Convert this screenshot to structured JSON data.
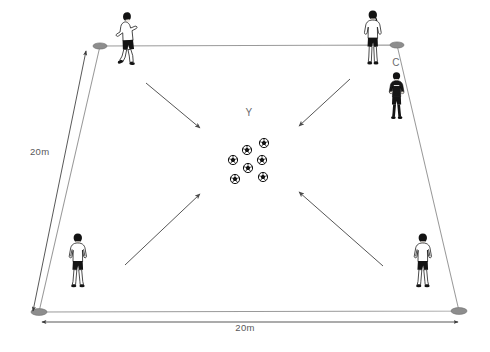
{
  "diagram": {
    "background_color": "#ffffff",
    "grid": {
      "line_color": "#9a9a9a",
      "corners": [
        {
          "name": "top-left",
          "x": 100,
          "y": 46
        },
        {
          "name": "top-right",
          "x": 397,
          "y": 45
        },
        {
          "name": "bottom-right",
          "x": 459,
          "y": 311
        },
        {
          "name": "bottom-left",
          "x": 39,
          "y": 312
        }
      ],
      "marker_color": "#8d8d8d"
    },
    "dimensions": [
      {
        "name": "left-side-dimension",
        "label": "20m",
        "label_x": 30,
        "label_y": 155,
        "from_x": 33,
        "from_y": 311,
        "to_x": 86,
        "to_y": 51
      },
      {
        "name": "bottom-dimension",
        "label": "20m",
        "label_x": 245,
        "label_y": 331,
        "from_x": 42,
        "from_y": 322,
        "to_x": 458,
        "to_y": 322
      }
    ],
    "labels": [
      {
        "name": "coach-label",
        "text": "C",
        "x": 396,
        "y": 66
      },
      {
        "name": "ball-group-label",
        "text": "Y",
        "x": 249,
        "y": 116
      }
    ],
    "players": [
      {
        "name": "player-top-left",
        "id": "P1",
        "x": 128,
        "y": 43,
        "kit": "white-shirt-black-shorts",
        "pose": "kicking"
      },
      {
        "name": "player-top-right",
        "id": "P2",
        "x": 375,
        "y": 40,
        "kit": "white-shirt-black-shorts",
        "pose": "standing-back-ponytail"
      },
      {
        "name": "player-bottom-left",
        "id": "P3",
        "x": 83,
        "y": 263,
        "kit": "white-shirt-black-shorts",
        "pose": "standing-back"
      },
      {
        "name": "player-bottom-right",
        "id": "P4",
        "x": 428,
        "y": 263,
        "kit": "white-shirt-black-shorts",
        "pose": "walking-back"
      },
      {
        "name": "coach-figure",
        "id": "C",
        "x": 399,
        "y": 97,
        "kit": "all-black-tracksuit",
        "pose": "standing"
      }
    ],
    "balls": {
      "name": "ball-cluster",
      "count": 7,
      "color": "#111111",
      "radius": 5.0,
      "positions": [
        {
          "x": 264,
          "y": 143
        },
        {
          "x": 247,
          "y": 150
        },
        {
          "x": 233,
          "y": 160
        },
        {
          "x": 262,
          "y": 160
        },
        {
          "x": 248,
          "y": 168
        },
        {
          "x": 235,
          "y": 179
        },
        {
          "x": 263,
          "y": 177
        }
      ]
    },
    "arrows": {
      "color": "#4d4d4d",
      "items": [
        {
          "name": "arrow-top-left-to-center",
          "x1": 146,
          "y1": 83,
          "x2": 200,
          "y2": 128
        },
        {
          "name": "arrow-top-right-to-center",
          "x1": 350,
          "y1": 79,
          "x2": 299,
          "y2": 126
        },
        {
          "name": "arrow-bottom-left-to-center",
          "x1": 125,
          "y1": 265,
          "x2": 200,
          "y2": 194
        },
        {
          "name": "arrow-bottom-right-to-center",
          "x1": 383,
          "y1": 266,
          "x2": 299,
          "y2": 192
        }
      ]
    }
  }
}
